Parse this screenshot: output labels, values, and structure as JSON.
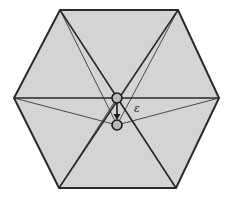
{
  "diagram": {
    "colors": {
      "fill": "#d4d4d4",
      "stroke": "#2a2a2a",
      "circle_fill": "#b8b8b8",
      "background": "#ffffff"
    },
    "hexagon": {
      "vertices": [
        [
          60,
          10
        ],
        [
          178,
          10
        ],
        [
          219,
          98
        ],
        [
          176,
          188
        ],
        [
          59,
          188
        ],
        [
          14,
          98
        ]
      ]
    },
    "points": {
      "p": {
        "x": 117,
        "y": 98,
        "r": 5
      },
      "q": {
        "x": 117,
        "y": 125,
        "r": 5
      }
    },
    "label": {
      "text": "ε",
      "x": 134,
      "y": 112
    }
  }
}
